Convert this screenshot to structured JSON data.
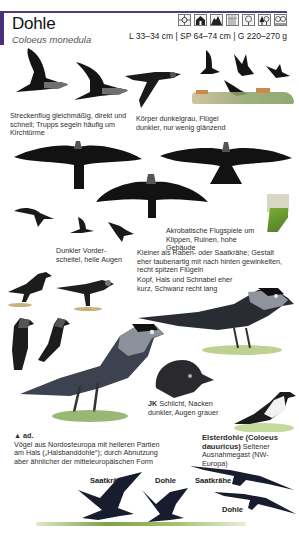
{
  "header": {
    "title": "Dohle",
    "latin_name": "Coloeus monedula",
    "measures": "L 33–34 cm | SP 64–74 cm | G 220–270 g",
    "accent_color": "#4b2f7a",
    "habitat_icons": [
      {
        "name": "town-crosshair-icon"
      },
      {
        "name": "house-icon"
      },
      {
        "name": "rock-cliff-icon"
      },
      {
        "name": "farmland-icon"
      },
      {
        "name": "open-woodland-icon"
      },
      {
        "name": "mixed-forest-icon"
      },
      {
        "name": "parkland-icon"
      }
    ]
  },
  "captions": {
    "flight": "Streckenflug gleichmäßig, direkt und schnell; Trupps segeln häufig um Kirchtürme",
    "body": "Körper dunkelgrau, Flügel dunkler, nur wenig glänzend",
    "acrobatic": "Akrobatische Flugspiele um Klippen, Ruinen, hohe Gebäude",
    "forehead": "Dunkler Vorder-scheitel, helle Augen",
    "size": "Kleiner als Raben- oder Saatkrähe; Gestalt eher taubenartig mit nach hinten gewinkelten, recht spitzen Flügeln",
    "head": "Kopf, Hals und Schnabel eher kurz, Schwanz recht lang",
    "juvenile_label": "JK",
    "juvenile": "Schlicht, Nacken dunkler, Augen grauer",
    "adult_label": "▲ ad.",
    "adult": "Vögel aus Nordosteuropa mit helleren Partien am Hals („Halsbanddohle“); durch Abnutzung aber ähnlicher der mitteleuropäischen Form",
    "daurian_name": "Elsterdohle (Coloeus dauuricus)",
    "daurian": "Seltener Ausnahmegast (NW-Europa)"
  },
  "comparison_labels": {
    "rook_left": "Saatkrähe",
    "jackdaw_left": "Dohle",
    "rook_right": "Saatkrähe",
    "jackdaw_right": "Dohle"
  }
}
